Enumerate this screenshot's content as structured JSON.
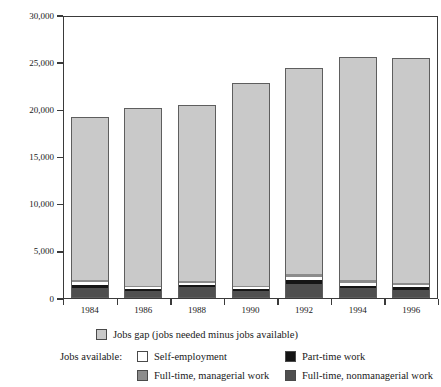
{
  "chart_data": {
    "type": "bar",
    "stacked": true,
    "title": "",
    "subtitle": "",
    "xlabel": "",
    "ylabel": "Thousands",
    "categories": [
      "1984",
      "1986",
      "1988",
      "1990",
      "1992",
      "1994",
      "1996"
    ],
    "ylim": [
      0,
      30000
    ],
    "yticks": [
      0,
      5000,
      10000,
      15000,
      20000,
      25000,
      30000
    ],
    "ytick_labels": [
      "0",
      "5,000",
      "10,000",
      "15,000",
      "20,000",
      "25,000",
      "30,000"
    ],
    "grid": false,
    "legend_position": "below",
    "series": [
      {
        "name": "Full-time, nonmanagerial work",
        "key": "nonmgr",
        "color": "#4f4f4f",
        "values": [
          1050,
          760,
          1130,
          760,
          1490,
          1010,
          900
        ]
      },
      {
        "name": "Part-time work",
        "key": "part",
        "color": "#161616",
        "values": [
          340,
          190,
          250,
          190,
          400,
          300,
          260
        ]
      },
      {
        "name": "Self-employment",
        "key": "self",
        "color": "#ffffff",
        "values": [
          300,
          180,
          230,
          190,
          330,
          330,
          240
        ]
      },
      {
        "name": "Full-time, managerial work",
        "key": "mgr",
        "color": "#8c8c8c",
        "values": [
          230,
          170,
          210,
          180,
          290,
          240,
          210
        ]
      },
      {
        "name": "Jobs gap (jobs needed minus jobs available)",
        "key": "gap",
        "color": "#c9c9c9",
        "values": [
          17280,
          18850,
          18680,
          21480,
          21890,
          23720,
          23890
        ]
      }
    ],
    "totals": [
      19200,
      20150,
      20500,
      22800,
      24400,
      25600,
      25500
    ],
    "annotations": []
  },
  "legend": {
    "row1": {
      "label": "Jobs gap (jobs needed minus jobs available)",
      "swatch": "gap-swatch"
    },
    "prefix": "Jobs available:",
    "row2_left": {
      "label": "Self-employment",
      "swatch": "self-employment-swatch"
    },
    "row2_right": {
      "label": "Part-time work",
      "swatch": "part-time-swatch"
    },
    "row3_left": {
      "label": "Full-time, managerial work",
      "swatch": "managerial-swatch"
    },
    "row3_right": {
      "label": "Full-time, nonmanagerial work",
      "swatch": "nonmanagerial-swatch"
    }
  },
  "axes": {
    "y_title": "Thousands"
  },
  "colors": {
    "jobs_gap": "#c9c9c9",
    "self_employment": "#ffffff",
    "part_time": "#161616",
    "full_time_managerial": "#8c8c8c",
    "full_time_nonmanagerial": "#4f4f4f",
    "axis": "#3a3a3a",
    "text": "#1a1a1a"
  }
}
